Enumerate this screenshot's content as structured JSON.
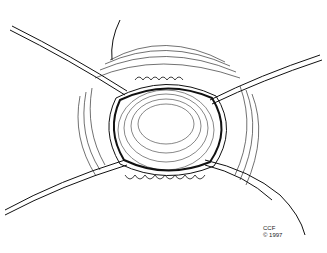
{
  "illustration": {
    "subject": "surgical line drawing of circular opening with retraction sutures",
    "credit_line1": "CCF",
    "credit_line2": "© 1997"
  }
}
